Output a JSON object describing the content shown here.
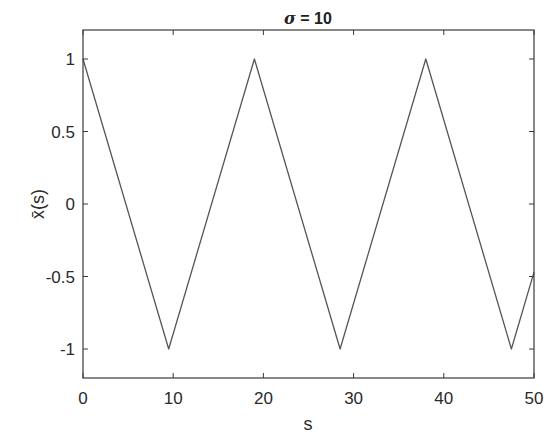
{
  "chart_data": {
    "type": "line",
    "title": "σ = 10",
    "title_parts": {
      "symbol": "σ",
      "rest": " = 10"
    },
    "xlabel": "s",
    "ylabel": "x̄(s)",
    "xlim": [
      0,
      50
    ],
    "ylim": [
      -1.2,
      1.2
    ],
    "grid": false,
    "legend": null,
    "x_ticks": [
      0,
      10,
      20,
      30,
      40,
      50
    ],
    "x_tick_labels": [
      "0",
      "10",
      "20",
      "30",
      "40",
      "50"
    ],
    "y_ticks": [
      -1,
      -0.5,
      0,
      0.5,
      1
    ],
    "y_tick_labels": [
      "-1",
      "-0.5",
      "0",
      "0.5",
      "1"
    ],
    "series": [
      {
        "name": "x̄(s)",
        "color": "#555555",
        "description": "Triangle wave, period ≈ 19, amplitude 1",
        "x": [
          0,
          9.5,
          19,
          28.5,
          38,
          47.5,
          50
        ],
        "y": [
          1,
          -1,
          1,
          -1,
          1,
          -1,
          -0.47
        ]
      }
    ]
  },
  "colors": {
    "axes": "#3a3a3a",
    "line": "#555555",
    "background": "#ffffff"
  }
}
